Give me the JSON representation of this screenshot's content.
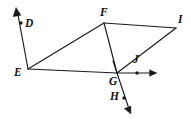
{
  "figure": {
    "background_color": "#ffffff",
    "stroke_color": "#1a1a1a",
    "label_color": "#111111",
    "width": 191,
    "height": 119,
    "points": {
      "D": {
        "label": "D",
        "x": 21,
        "y": 23,
        "label_x": 25,
        "label_y": 18,
        "marked": true
      },
      "E": {
        "label": "E",
        "x": 28,
        "y": 69,
        "label_x": 14,
        "label_y": 67,
        "marked": false
      },
      "F": {
        "label": "F",
        "x": 104,
        "y": 23,
        "label_x": 100,
        "label_y": 7,
        "marked": false
      },
      "G": {
        "label": "G",
        "x": 117,
        "y": 73,
        "label_x": 109,
        "label_y": 76,
        "marked": false
      },
      "H": {
        "label": "H",
        "x": 124,
        "y": 98,
        "label_x": 110,
        "label_y": 91,
        "marked": true
      },
      "I": {
        "label": "I",
        "x": 176,
        "y": 28,
        "label_x": 178,
        "label_y": 14,
        "marked": false
      },
      "J": {
        "label": "J",
        "x": 137,
        "y": 73,
        "label_x": 133,
        "label_y": 54,
        "marked": true
      }
    },
    "segments": [
      {
        "name": "segment-E-F",
        "from": "E",
        "to": "F"
      },
      {
        "name": "segment-F-I",
        "from": "F",
        "to": "I"
      },
      {
        "name": "segment-E-G",
        "from": "E",
        "to": "G"
      },
      {
        "name": "segment-F-G",
        "from": "F",
        "to": "G"
      },
      {
        "name": "segment-G-I",
        "from": "G",
        "to": "I"
      }
    ],
    "rays": [
      {
        "name": "ray-E-D",
        "from": "E",
        "through": "D",
        "tip_x": 16,
        "tip_y": 8
      },
      {
        "name": "ray-G-J",
        "from": "G",
        "through": "J",
        "tip_x": 156,
        "tip_y": 73
      },
      {
        "name": "ray-G-H",
        "from": "G",
        "through": "H",
        "tip_x": 131,
        "tip_y": 113
      }
    ]
  }
}
